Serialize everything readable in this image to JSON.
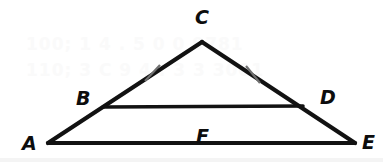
{
  "figure": {
    "width": 383,
    "height": 162,
    "background_color": "#ffffff",
    "stroke_color": "#121212",
    "tick_color": "#6f6f6f",
    "label_color": "#0d0d0d"
  },
  "points": {
    "A": {
      "label": "A",
      "x": 48,
      "y": 143,
      "label_x": 22,
      "label_y": 134
    },
    "B": {
      "label": "B",
      "x": 103,
      "y": 107,
      "label_x": 76,
      "label_y": 89
    },
    "C": {
      "label": "C",
      "x": 202,
      "y": 42,
      "label_x": 195,
      "label_y": 8
    },
    "D": {
      "label": "D",
      "x": 303,
      "y": 106,
      "label_x": 320,
      "label_y": 88
    },
    "E": {
      "label": "E",
      "x": 355,
      "y": 143,
      "label_x": 362,
      "label_y": 133
    },
    "F": {
      "label": "F",
      "x": 200,
      "y": 120,
      "label_x": 196,
      "label_y": 127
    }
  },
  "segments": [
    {
      "name": "segment-A-C",
      "from": "A",
      "to": "C",
      "x1": 48,
      "y1": 143,
      "x2": 202,
      "y2": 42
    },
    {
      "name": "segment-C-E",
      "from": "C",
      "to": "E",
      "x1": 202,
      "y1": 42,
      "x2": 355,
      "y2": 143
    },
    {
      "name": "segment-A-E",
      "from": "A",
      "to": "E",
      "x1": 48,
      "y1": 143,
      "x2": 355,
      "y2": 143
    },
    {
      "name": "segment-B-D",
      "from": "B",
      "to": "D",
      "x1": 103,
      "y1": 107,
      "x2": 303,
      "y2": 106
    }
  ],
  "congruence_ticks": [
    {
      "name": "tick-mark-BC",
      "on_segment": "segment-B-C",
      "x1": 145,
      "y1": 81,
      "x2": 160,
      "y2": 65
    },
    {
      "name": "tick-mark-CD",
      "on_segment": "segment-C-D",
      "x1": 246,
      "y1": 66,
      "x2": 260,
      "y2": 83
    }
  ],
  "watermark": {
    "line1": "100;  1 4 . 5 0 0   9781",
    "line2": "110;  3 C 9 4 . 3 3   3001"
  }
}
